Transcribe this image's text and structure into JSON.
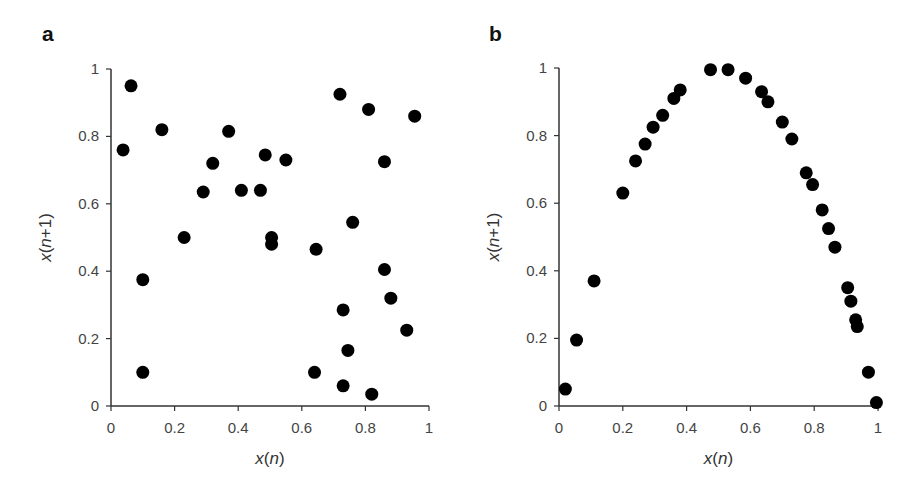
{
  "chart_data": [
    {
      "type": "scatter",
      "panel": "a",
      "title": "",
      "xlabel": "x(n)",
      "ylabel": "x(n+1)",
      "xlim": [
        0,
        1
      ],
      "ylim": [
        0,
        1
      ],
      "xticks": [
        "0",
        "0.2",
        "0.4",
        "0.6",
        "0.8",
        "1"
      ],
      "yticks": [
        "0",
        "0.2",
        "0.4",
        "0.6",
        "0.8",
        "1"
      ],
      "grid": false,
      "legend": null,
      "points": [
        [
          0.038,
          0.76
        ],
        [
          0.063,
          0.95
        ],
        [
          0.16,
          0.82
        ],
        [
          0.37,
          0.815
        ],
        [
          0.32,
          0.72
        ],
        [
          0.29,
          0.635
        ],
        [
          0.41,
          0.64
        ],
        [
          0.47,
          0.64
        ],
        [
          0.485,
          0.745
        ],
        [
          0.23,
          0.5
        ],
        [
          0.55,
          0.73
        ],
        [
          0.86,
          0.725
        ],
        [
          0.76,
          0.545
        ],
        [
          0.505,
          0.5
        ],
        [
          0.505,
          0.48
        ],
        [
          0.645,
          0.465
        ],
        [
          0.86,
          0.405
        ],
        [
          0.72,
          0.925
        ],
        [
          0.81,
          0.88
        ],
        [
          0.955,
          0.86
        ],
        [
          0.1,
          0.375
        ],
        [
          0.1,
          0.1
        ],
        [
          0.73,
          0.285
        ],
        [
          0.745,
          0.165
        ],
        [
          0.88,
          0.32
        ],
        [
          0.93,
          0.225
        ],
        [
          0.64,
          0.1
        ],
        [
          0.73,
          0.06
        ],
        [
          0.82,
          0.035
        ]
      ]
    },
    {
      "type": "scatter",
      "panel": "b",
      "title": "",
      "xlabel": "x(n)",
      "ylabel": "x(n+1)",
      "xlim": [
        0,
        1
      ],
      "ylim": [
        0,
        1
      ],
      "xticks": [
        "0",
        "0.2",
        "0.4",
        "0.6",
        "0.8",
        "1"
      ],
      "yticks": [
        "0",
        "0.2",
        "0.4",
        "0.6",
        "0.8",
        "1"
      ],
      "grid": false,
      "legend": null,
      "points": [
        [
          0.02,
          0.05
        ],
        [
          0.055,
          0.195
        ],
        [
          0.11,
          0.37
        ],
        [
          0.2,
          0.63
        ],
        [
          0.24,
          0.725
        ],
        [
          0.27,
          0.775
        ],
        [
          0.295,
          0.825
        ],
        [
          0.325,
          0.86
        ],
        [
          0.36,
          0.91
        ],
        [
          0.38,
          0.935
        ],
        [
          0.475,
          0.995
        ],
        [
          0.53,
          0.995
        ],
        [
          0.585,
          0.97
        ],
        [
          0.635,
          0.93
        ],
        [
          0.655,
          0.9
        ],
        [
          0.7,
          0.84
        ],
        [
          0.73,
          0.79
        ],
        [
          0.775,
          0.69
        ],
        [
          0.795,
          0.655
        ],
        [
          0.825,
          0.58
        ],
        [
          0.845,
          0.525
        ],
        [
          0.865,
          0.47
        ],
        [
          0.905,
          0.35
        ],
        [
          0.915,
          0.31
        ],
        [
          0.93,
          0.255
        ],
        [
          0.935,
          0.235
        ],
        [
          0.97,
          0.1
        ],
        [
          0.995,
          0.01
        ]
      ]
    }
  ],
  "panels": {
    "a": {
      "label": "a"
    },
    "b": {
      "label": "b"
    }
  },
  "colors": {
    "marker": "#000000",
    "axis": "#333333",
    "text": "#444444"
  }
}
